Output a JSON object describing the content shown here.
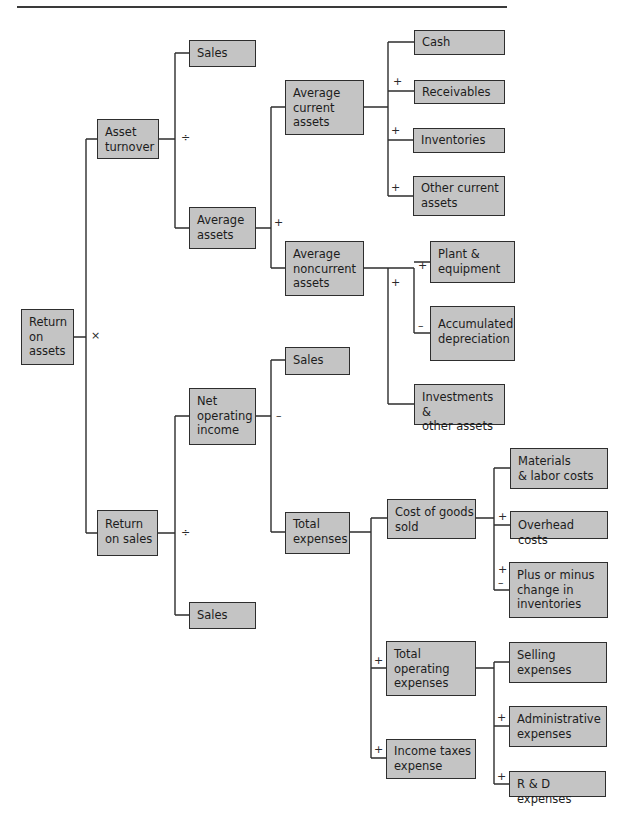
{
  "diagram": {
    "nodes": {
      "roa": "Return\non\nassets",
      "asset_turnover": "Asset\nturnover",
      "return_on_sales": "Return\non sales",
      "sales_top": "Sales",
      "average_assets": "Average\nassets",
      "net_operating_income": "Net\noperating\nincome",
      "sales_bottom": "Sales",
      "sales_mid": "Sales",
      "total_expenses": "Total\nexpenses",
      "avg_current_assets": "Average\ncurrent\nassets",
      "avg_noncurrent_assets": "Average\nnoncurrent\nassets",
      "cash": "Cash",
      "receivables": "Receivables",
      "inventories": "Inventories",
      "other_current_assets": "Other current\nassets",
      "plant_equipment": "Plant &\nequipment",
      "accumulated_depreciation": "Accumulated\ndepreciation",
      "investments_other": "Investments &\nother assets",
      "cogs": "Cost of goods\nsold",
      "materials_labor": "Materials\n& labor costs",
      "overhead": "Overhead costs",
      "change_inventories": "Plus or minus\nchange in\ninventories",
      "total_operating_expenses": "Total\noperating\nexpenses",
      "income_taxes": "Income taxes\nexpense",
      "selling_expenses": "Selling\nexpenses",
      "administrative_expenses": "Administrative\nexpenses",
      "rd_expenses": "R & D expenses"
    },
    "operators": {
      "roa_times": "×",
      "at_divide": "÷",
      "ros_divide": "÷",
      "assets_plus": "+",
      "noi_minus": "–",
      "receivables_plus": "+",
      "inventories_plus": "+",
      "other_plus": "+",
      "noncurrent_plus": "+",
      "plant_plus": "+",
      "accum_minus": "–",
      "overhead_plus": "+",
      "change_plus": "+",
      "change_minus": "–",
      "toe_plus": "+",
      "taxes_plus": "+",
      "admin_plus": "+",
      "rd_plus": "+"
    },
    "colors": {
      "box_fill": "#c4c4c4",
      "box_border": "#2e2e2e",
      "line": "#2e2e2e"
    }
  }
}
